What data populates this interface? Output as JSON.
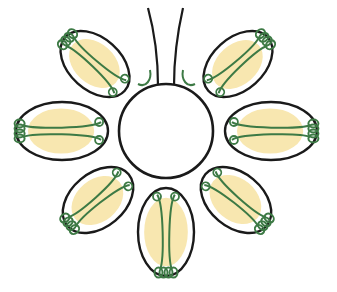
{
  "diagram": {
    "type": "radial-flower",
    "colors": {
      "outline": "#1a1a1a",
      "fill_inner": "#f8e7b0",
      "coil": "#3d7a45",
      "background": "#ffffff"
    },
    "center": {
      "cx": 166,
      "cy": 131,
      "r": 47
    },
    "stalk": {
      "present": true
    },
    "petals": [
      {
        "name": "upper-left",
        "cx": 95,
        "cy": 64,
        "rx": 40,
        "ry": 26,
        "angle": 42
      },
      {
        "name": "upper-right",
        "cx": 238,
        "cy": 64,
        "rx": 40,
        "ry": 26,
        "angle": -42
      },
      {
        "name": "left",
        "cx": 62,
        "cy": 131,
        "rx": 46,
        "ry": 29,
        "angle": 0
      },
      {
        "name": "right",
        "cx": 271,
        "cy": 131,
        "rx": 46,
        "ry": 29,
        "angle": 0
      },
      {
        "name": "lower-left",
        "cx": 98,
        "cy": 200,
        "rx": 40,
        "ry": 27,
        "angle": -40
      },
      {
        "name": "lower-right",
        "cx": 236,
        "cy": 200,
        "rx": 40,
        "ry": 27,
        "angle": 40
      },
      {
        "name": "bottom",
        "cx": 166,
        "cy": 232,
        "rx": 28,
        "ry": 44,
        "angle": 0
      }
    ]
  }
}
